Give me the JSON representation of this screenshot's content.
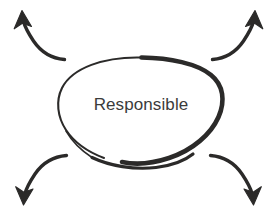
{
  "canvas": {
    "width": 277,
    "height": 216,
    "background": "#ffffff"
  },
  "diagram": {
    "type": "hand-drawn-concept-bubble",
    "style": "sketch",
    "ink_color": "#2b2a29",
    "text_color": "#3b3b3b"
  },
  "node": {
    "label": "Responsible",
    "shape": "ellipse",
    "center_x": 141,
    "center_y": 105,
    "radius_x": 82,
    "radius_y": 54,
    "stroke_color": "#2b2a29",
    "fill": "none"
  },
  "arrows": [
    {
      "id": "arrow-top-left",
      "label": "",
      "direction": "up-left",
      "tail_x": 64,
      "tail_y": 60,
      "head_x": 22,
      "head_y": 14,
      "color": "#2b2a29"
    },
    {
      "id": "arrow-top-right",
      "label": "",
      "direction": "up-right",
      "tail_x": 213,
      "tail_y": 60,
      "head_x": 254,
      "head_y": 14,
      "color": "#2b2a29"
    },
    {
      "id": "arrow-bottom-left",
      "label": "",
      "direction": "down-left",
      "tail_x": 64,
      "tail_y": 155,
      "head_x": 23,
      "head_y": 201,
      "color": "#2b2a29"
    },
    {
      "id": "arrow-bottom-right",
      "label": "",
      "direction": "down-right",
      "tail_x": 213,
      "tail_y": 155,
      "head_x": 254,
      "head_y": 201,
      "color": "#2b2a29"
    }
  ]
}
